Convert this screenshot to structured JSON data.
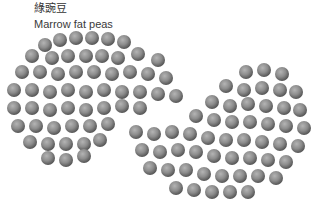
{
  "caption": {
    "chinese": "綠豌豆",
    "english": "Marrow fat peas"
  },
  "image": {
    "subject": "dried marrowfat peas arranged in a yin-yang style swirl",
    "background": "#ffffff",
    "pea_color": "#8a8a8a"
  }
}
